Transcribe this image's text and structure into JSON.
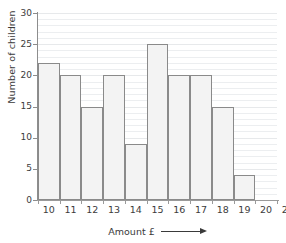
{
  "chart_data": {
    "type": "bar",
    "title": "",
    "subtitle": "",
    "xlabel": "Amount £",
    "ylabel": "Number of children",
    "categories": [
      "10",
      "11",
      "12",
      "13",
      "14",
      "15",
      "16",
      "17",
      "18",
      "19"
    ],
    "values": [
      22,
      20,
      15,
      20,
      9,
      25,
      20,
      20,
      15,
      4
    ],
    "series": [
      {
        "name": "Number of children",
        "values": [
          22,
          20,
          15,
          20,
          9,
          25,
          20,
          20,
          15,
          4
        ]
      }
    ],
    "xlim": [
      10,
      21
    ],
    "ylim": [
      0,
      30
    ],
    "x_tick_labels": [
      "10",
      "11",
      "12",
      "13",
      "14",
      "15",
      "16",
      "17",
      "18",
      "19",
      "20",
      "21"
    ],
    "y_tick_labels": [
      "0",
      "5",
      "10",
      "15",
      "20",
      "25",
      "30"
    ],
    "y_tick_step": 5,
    "y_minor_gridline_step": 1,
    "grid": true,
    "grid_orientation": "horizontal",
    "legend": false,
    "legend_position": "none",
    "annotations": [],
    "x_axis_arrow": true,
    "bar_fill_color": "#f3f3f3",
    "bar_border_color": "#8a8a8a",
    "gridline_color": "#eceef0",
    "axis_color": "#8d8d8d",
    "text_color": "#3a3a3a",
    "background_color": "#ffffff"
  }
}
